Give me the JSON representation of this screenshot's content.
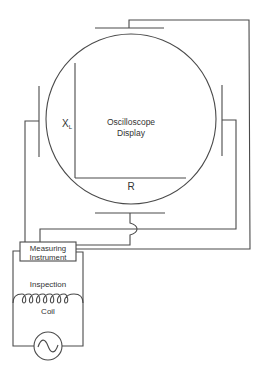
{
  "diagram": {
    "type": "circuit-schematic",
    "components": {
      "oscilloscope": {
        "label_line1": "Oscilloscope",
        "label_line2": "Display",
        "y_axis_label": "X",
        "y_axis_subscript": "L",
        "x_axis_label": "R"
      },
      "instrument": {
        "label_line1": "Measuring",
        "label_line2": "Instrument"
      },
      "coil": {
        "label_line1": "Inspection",
        "label_line2": "Coil",
        "loops": 7
      },
      "source": {
        "symbol": "ac-source"
      },
      "deflection_plates": [
        "top",
        "bottom",
        "left",
        "right"
      ]
    },
    "colors": {
      "line": "#4a4a4a",
      "text": "#333333",
      "background": "#ffffff"
    }
  }
}
